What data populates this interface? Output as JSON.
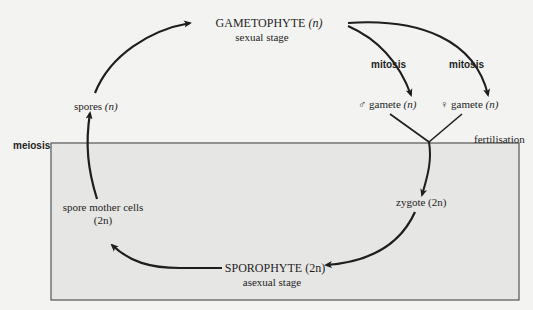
{
  "diagram": {
    "nodes": {
      "gametophyte": {
        "label": "GAMETOPHYTE",
        "ploidy": "(n)",
        "sublabel": "sexual stage"
      },
      "male_gamete": {
        "symbol": "♂",
        "label": "gamete",
        "ploidy": "(n)"
      },
      "female_gamete": {
        "symbol": "♀",
        "label": "gamete",
        "ploidy": "(n)"
      },
      "zygote": {
        "label": "zygote",
        "ploidy": "(2n)"
      },
      "sporophyte": {
        "label": "SPOROPHYTE",
        "ploidy": "(2n)",
        "sublabel": "asexual stage"
      },
      "spore_mother_cells": {
        "label": "spore mother cells",
        "ploidy": "(2n)"
      },
      "spores": {
        "label": "spores",
        "ploidy": "(n)"
      }
    },
    "processes": {
      "mitosis_male": "mitosis",
      "mitosis_female": "mitosis",
      "fertilisation": "fertilisation",
      "meiosis": "meiosis"
    },
    "regions": {
      "diploid_box": "diploid phase (2n)"
    },
    "colors": {
      "background": "#f3f3f1",
      "box_fill": "#e6e6e4",
      "line": "#1e1e1e",
      "box_border": "#555555"
    }
  }
}
